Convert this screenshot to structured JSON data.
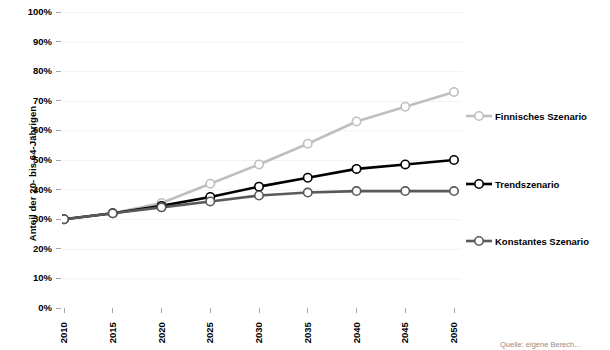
{
  "chart_data": {
    "type": "line",
    "title": "",
    "xlabel": "",
    "ylabel": "Anteil der 20- bis 64-Jährigen",
    "x": [
      2010,
      2015,
      2020,
      2025,
      2030,
      2035,
      2040,
      2045,
      2050
    ],
    "x_tick_labels": [
      "2010",
      "2015",
      "2020",
      "2025",
      "2030",
      "2035",
      "2040",
      "2045",
      "2050"
    ],
    "y_tick_labels": [
      "100%",
      "90%",
      "80%",
      "70%",
      "60%",
      "50%",
      "40%",
      "30%",
      "20%",
      "10%",
      "0%"
    ],
    "y_tick_values": [
      100,
      90,
      80,
      70,
      60,
      50,
      40,
      30,
      20,
      10,
      0
    ],
    "ylim": [
      0,
      100
    ],
    "xlim": [
      2010,
      2050
    ],
    "grid": true,
    "grid_axis": "y",
    "legend_position": "right",
    "series": [
      {
        "name": "Finnisches Szenario",
        "color": "#bfbfbf",
        "marker": "circle-open",
        "values": [
          30,
          32,
          35.5,
          42,
          48.5,
          55.5,
          63,
          68,
          73
        ]
      },
      {
        "name": "Trendszenario",
        "color": "#000000",
        "marker": "circle-open",
        "values": [
          30,
          32,
          34.5,
          37.5,
          41,
          44,
          47,
          48.5,
          50
        ]
      },
      {
        "name": "Konstantes Szenario",
        "color": "#595959",
        "marker": "circle-open",
        "values": [
          30,
          32,
          34,
          36,
          38,
          39,
          39.5,
          39.5,
          39.5
        ]
      }
    ],
    "annotations": [
      {
        "name": "source-note",
        "text": "Quelle: eigene Berech..."
      }
    ],
    "style": {
      "background": "#ffffff",
      "gridline_color": "#f2f2f2",
      "axis_color": "#a6a6a6",
      "text_color": "#000000",
      "marker_fill": "#ffffff"
    }
  }
}
